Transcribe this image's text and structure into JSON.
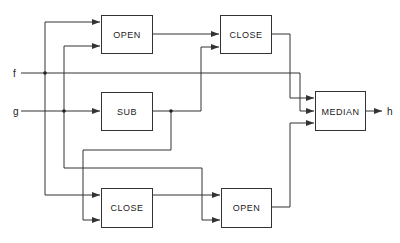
{
  "diagram": {
    "inputs": [
      {
        "id": "f",
        "label": "f"
      },
      {
        "id": "g",
        "label": "g"
      }
    ],
    "output": {
      "id": "h",
      "label": "h"
    },
    "blocks": [
      {
        "id": "open_top",
        "label": "OPEN"
      },
      {
        "id": "close_top",
        "label": "CLOSE"
      },
      {
        "id": "sub",
        "label": "SUB"
      },
      {
        "id": "median",
        "label": "MEDIAN"
      },
      {
        "id": "close_bottom",
        "label": "CLOSE"
      },
      {
        "id": "open_bottom",
        "label": "OPEN"
      }
    ],
    "connections": [
      {
        "from": "f",
        "to": "open_top"
      },
      {
        "from": "f",
        "to": "close_bottom"
      },
      {
        "from": "f",
        "to": "median"
      },
      {
        "from": "g",
        "to": "sub"
      },
      {
        "from": "g",
        "to": "open_top"
      },
      {
        "from": "g",
        "to": "open_bottom"
      },
      {
        "from": "sub",
        "to": "close_top"
      },
      {
        "from": "sub",
        "to": "close_bottom"
      },
      {
        "from": "open_top",
        "to": "close_top"
      },
      {
        "from": "close_bottom",
        "to": "open_bottom"
      },
      {
        "from": "close_top",
        "to": "median"
      },
      {
        "from": "open_bottom",
        "to": "median"
      },
      {
        "from": "median",
        "to": "h"
      }
    ]
  }
}
